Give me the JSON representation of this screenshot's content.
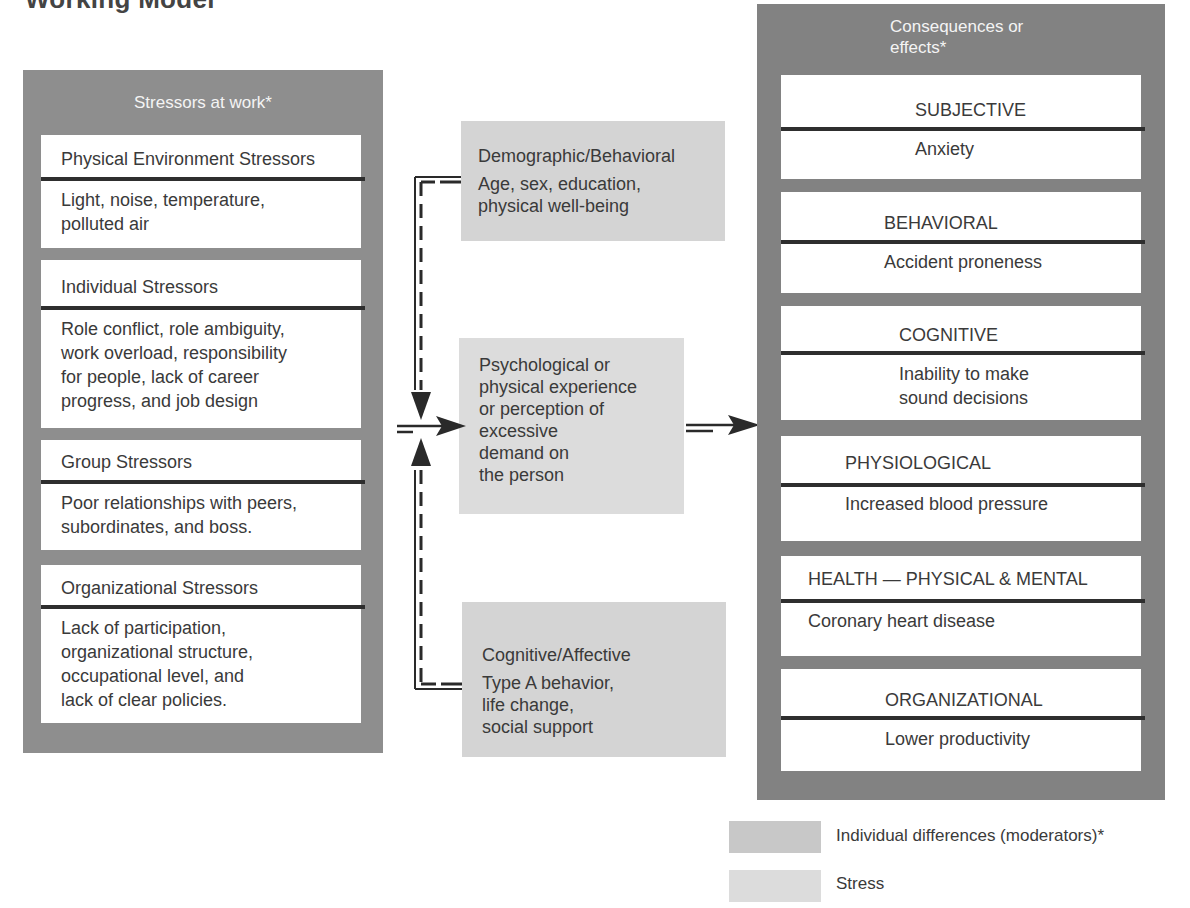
{
  "heading": "Working Model",
  "stressors": {
    "title": "Stressors at work*",
    "groups": [
      {
        "header": "Physical Environment Stressors",
        "body": [
          "Light, noise, temperature,",
          "polluted air"
        ]
      },
      {
        "header": "Individual Stressors",
        "body": [
          "Role conflict, role ambiguity,",
          "work overload, responsibility",
          "for people, lack of career",
          "progress, and job design"
        ]
      },
      {
        "header": "Group Stressors",
        "body": [
          "Poor relationships with peers,",
          "subordinates, and boss."
        ]
      },
      {
        "header": "Organizational Stressors",
        "body": [
          "Lack of participation,",
          "organizational structure,",
          "occupational level, and",
          "lack of clear policies."
        ]
      }
    ]
  },
  "moderators": [
    {
      "header": "Demographic/Behavioral",
      "body": [
        "Age, sex, education,",
        "physical well-being"
      ]
    },
    {
      "header": "Cognitive/Affective",
      "body": [
        "Type A behavior,",
        "life change,",
        "social support"
      ]
    }
  ],
  "stress_box": {
    "lines": [
      "Psychological or",
      "physical experience",
      "or perception of",
      "excessive",
      "demand on",
      "the person"
    ]
  },
  "consequences": {
    "title_lines": [
      "Consequences or",
      "effects*"
    ],
    "groups": [
      {
        "header": "SUBJECTIVE",
        "body": [
          "Anxiety"
        ]
      },
      {
        "header": "BEHAVIORAL",
        "body": [
          "Accident proneness"
        ]
      },
      {
        "header": "COGNITIVE",
        "body": [
          "Inability to make",
          "sound decisions"
        ]
      },
      {
        "header": "PHYSIOLOGICAL",
        "body": [
          "Increased blood pressure"
        ]
      },
      {
        "header": "HEALTH — PHYSICAL & MENTAL",
        "body": [
          "Coronary heart disease"
        ]
      },
      {
        "header": "ORGANIZATIONAL",
        "body": [
          "Lower productivity"
        ]
      }
    ]
  },
  "legend": [
    {
      "label": "Individual differences (moderators)*",
      "color": "#c8c8c8"
    },
    {
      "label": "Stress",
      "color": "#dcdcdc"
    }
  ],
  "colors": {
    "stressor_panel": "#8e8e8e",
    "consequence_panel": "#828282",
    "moderator_fill": "#d4d4d4",
    "stress_fill": "#dcdcdc",
    "rule": "#2e2e2e"
  }
}
